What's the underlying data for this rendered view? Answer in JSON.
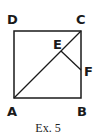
{
  "figure": {
    "caption": "Ex. 5",
    "shape": "square ABCD with diagonal AC, point E on AC, point F on BC, segment EF",
    "points": {
      "A": {
        "label": "A",
        "x": 14,
        "y": 98
      },
      "B": {
        "label": "B",
        "x": 81,
        "y": 98
      },
      "C": {
        "label": "C",
        "x": 81,
        "y": 31
      },
      "D": {
        "label": "D",
        "x": 14,
        "y": 31
      },
      "E": {
        "label": "E",
        "x": 61,
        "y": 51
      },
      "F": {
        "label": "F",
        "x": 81,
        "y": 70
      }
    },
    "segments": [
      "AB",
      "BC",
      "CD",
      "DA",
      "AC",
      "EF"
    ],
    "stroke_color": "#1a1a1a"
  }
}
